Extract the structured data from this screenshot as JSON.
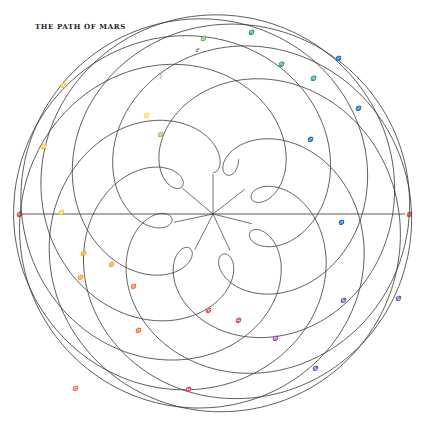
{
  "title": "THE PATH OF MARS",
  "diagram": {
    "center": [
      213,
      214
    ],
    "scale_px_per_au": 79,
    "earth_orbit_au": 1.0,
    "mars_orbit_au": 1.524,
    "earth_period_yr": 1.0,
    "mars_period_yr": 1.881,
    "duration_yr": 15.1,
    "line_color": "#333333",
    "axis": {
      "y": 214,
      "x1": 18,
      "x2": 405,
      "left_label": "♈",
      "right_label": "♈"
    },
    "spokes_angles_deg": [
      90,
      38,
      -14,
      -65,
      -117,
      -168,
      140
    ],
    "labels": [
      {
        "x": 195,
        "y": 52,
        "t": "♂"
      },
      {
        "x": 160,
        "y": 78,
        "t": "|"
      },
      {
        "x": 200,
        "y": 40,
        "t": "♎"
      },
      {
        "x": 248,
        "y": 34,
        "t": "♏"
      },
      {
        "x": 278,
        "y": 66,
        "t": "♏"
      },
      {
        "x": 310,
        "y": 80,
        "t": "♏"
      },
      {
        "x": 335,
        "y": 60,
        "t": "♐"
      },
      {
        "x": 355,
        "y": 110,
        "t": "♐"
      },
      {
        "x": 307,
        "y": 141,
        "t": "♐"
      },
      {
        "x": 60,
        "y": 87,
        "t": "♋"
      },
      {
        "x": 40,
        "y": 148,
        "t": "♋"
      },
      {
        "x": 58,
        "y": 214,
        "t": "♋"
      },
      {
        "x": 80,
        "y": 255,
        "t": "♊"
      },
      {
        "x": 143,
        "y": 117,
        "t": "♌"
      },
      {
        "x": 157,
        "y": 136,
        "t": "♍"
      },
      {
        "x": 77,
        "y": 279,
        "t": "♊"
      },
      {
        "x": 130,
        "y": 288,
        "t": "♉"
      },
      {
        "x": 135,
        "y": 332,
        "t": "♉"
      },
      {
        "x": 205,
        "y": 312,
        "t": "♈"
      },
      {
        "x": 235,
        "y": 322,
        "t": "♓"
      },
      {
        "x": 272,
        "y": 340,
        "t": "♒"
      },
      {
        "x": 312,
        "y": 370,
        "t": "♑"
      },
      {
        "x": 185,
        "y": 391,
        "t": "♓"
      },
      {
        "x": 72,
        "y": 390,
        "t": "♉"
      },
      {
        "x": 340,
        "y": 302,
        "t": "♑"
      },
      {
        "x": 395,
        "y": 300,
        "t": "♑"
      },
      {
        "x": 338,
        "y": 224,
        "t": "♐"
      },
      {
        "x": 108,
        "y": 266,
        "t": "♊"
      }
    ]
  }
}
